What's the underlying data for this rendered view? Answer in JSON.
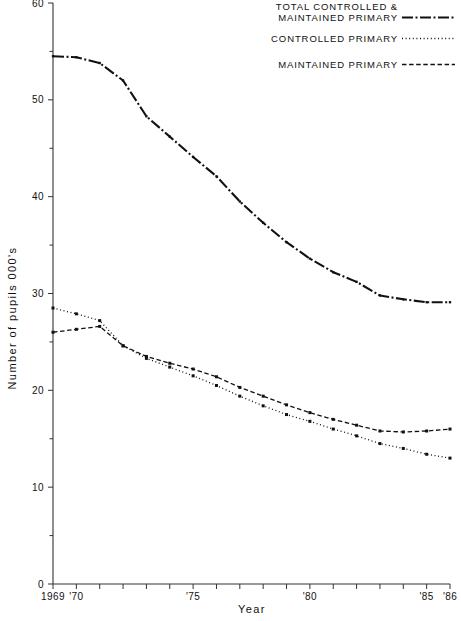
{
  "chart_data": {
    "type": "line",
    "title": "",
    "xlabel": "Year",
    "ylabel": "Number of pupils  000's",
    "xlim": [
      1969,
      1986
    ],
    "ylim": [
      0,
      60
    ],
    "grid": false,
    "legend_position": "top-right",
    "x": [
      1969,
      1970,
      1971,
      1972,
      1973,
      1974,
      1975,
      1976,
      1977,
      1978,
      1979,
      1980,
      1981,
      1982,
      1983,
      1984,
      1985,
      1986
    ],
    "x_tick_labels": [
      "1969",
      "'70",
      "",
      "",
      "",
      "",
      "'75",
      "",
      "",
      "",
      "",
      "'80",
      "",
      "",
      "",
      "",
      "'85",
      "'86"
    ],
    "y_ticks_major": [
      0,
      10,
      20,
      30,
      40,
      50,
      60
    ],
    "y_ticks_minor": [
      5,
      15,
      25,
      35,
      45,
      55
    ],
    "series": [
      {
        "name": "TOTAL CONTROLLED & MAINTAINED PRIMARY",
        "style": "dash-dot",
        "values": [
          54.5,
          54.4,
          53.8,
          52.0,
          48.3,
          46.2,
          44.1,
          42.1,
          39.5,
          37.3,
          35.3,
          33.6,
          32.2,
          31.2,
          29.8,
          29.4,
          29.1,
          29.1
        ]
      },
      {
        "name": "CONTROLLED PRIMARY",
        "style": "dotted",
        "values": [
          28.5,
          27.9,
          27.2,
          24.6,
          23.3,
          22.4,
          21.5,
          20.5,
          19.4,
          18.4,
          17.5,
          16.8,
          16.0,
          15.3,
          14.5,
          14.0,
          13.4,
          13.0
        ]
      },
      {
        "name": "MAINTAINED PRIMARY",
        "style": "dashed",
        "values": [
          26.0,
          26.3,
          26.6,
          24.6,
          23.5,
          22.8,
          22.2,
          21.4,
          20.3,
          19.4,
          18.5,
          17.7,
          17.0,
          16.4,
          15.8,
          15.7,
          15.8,
          16.0
        ]
      }
    ]
  },
  "axes": {
    "y_title": "Number of pupils  000's",
    "x_title": "Year",
    "y_tick_labels": {
      "t0": "0",
      "t10": "10",
      "t20": "20",
      "t30": "30",
      "t40": "40",
      "t50": "50",
      "t60": "60"
    },
    "x_tick_labels": {
      "start": "1969",
      "y70": "'70",
      "y75": "'75",
      "y80": "'80",
      "y85": "'85",
      "y86": "'86"
    }
  },
  "legend": {
    "items": [
      {
        "line1": "TOTAL CONTROLLED &",
        "line2": "MAINTAINED PRIMARY",
        "style": "dash-dot"
      },
      {
        "line1": "CONTROLLED PRIMARY",
        "line2": "",
        "style": "dotted"
      },
      {
        "line1": "MAINTAINED PRIMARY",
        "line2": "",
        "style": "dashed"
      }
    ]
  },
  "colors": {
    "ink": "#111111",
    "axis": "#333333",
    "background": "#ffffff"
  }
}
